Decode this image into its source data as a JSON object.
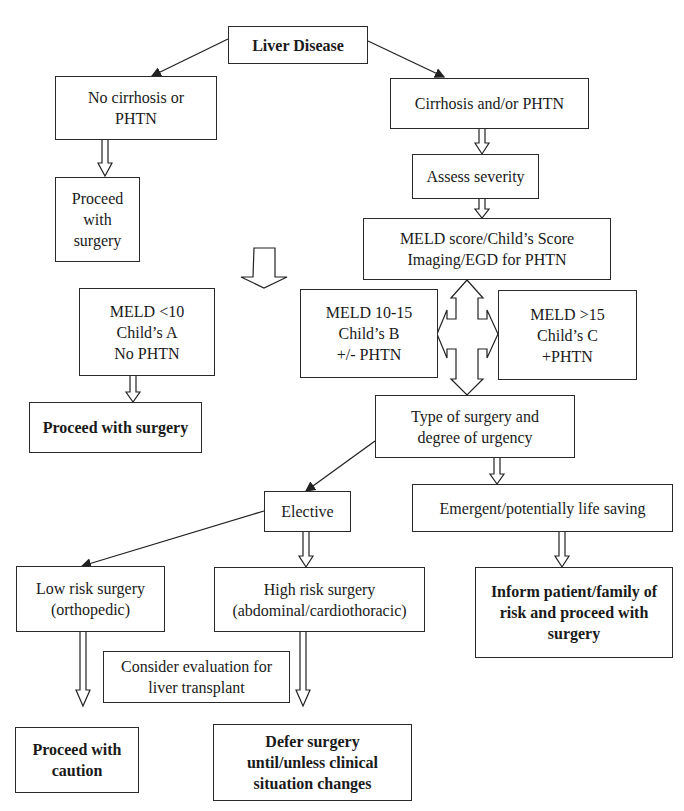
{
  "diagram": {
    "title": "Liver Disease",
    "nodes": {
      "liver_disease": "Liver Disease",
      "no_cirrhosis": "No cirrhosis or\nPHTN",
      "cirrhosis": "Cirrhosis and/or PHTN",
      "proceed_small": "Proceed\nwith\nsurgery",
      "assess_severity": "Assess severity",
      "meld_score": "MELD score/Child’s Score\nImaging/EGD for PHTN",
      "meld_lt10": "MELD <10\nChild’s A\nNo PHTN",
      "meld_10_15": "MELD 10-15\nChild’s B\n+/- PHTN",
      "meld_gt15": "MELD >15\nChild’s C\n+PHTN",
      "proceed_surgery": "Proceed with surgery",
      "type_of_surgery": "Type of surgery and\ndegree of urgency",
      "elective": "Elective",
      "emergent": "Emergent/potentially life saving",
      "low_risk": "Low risk surgery\n(orthopedic)",
      "high_risk": "High risk surgery\n(abdominal/cardiothoracic)",
      "inform_patient": "Inform patient/family of\nrisk and proceed with\nsurgery",
      "consider_transplant": "Consider evaluation for\nliver transplant",
      "proceed_caution": "Proceed with\ncaution",
      "defer_surgery": "Defer surgery\nuntil/unless clinical\nsituation changes"
    },
    "edges": [
      {
        "from": "liver_disease",
        "to": "no_cirrhosis",
        "style": "line-arrow"
      },
      {
        "from": "liver_disease",
        "to": "cirrhosis",
        "style": "line-arrow"
      },
      {
        "from": "no_cirrhosis",
        "to": "proceed_small",
        "style": "hollow-arrow"
      },
      {
        "from": "cirrhosis",
        "to": "assess_severity",
        "style": "hollow-arrow"
      },
      {
        "from": "assess_severity",
        "to": "meld_score",
        "style": "hollow-arrow"
      },
      {
        "from": "meld_score",
        "to": "meld_lt10",
        "style": "big-hollow-arrow"
      },
      {
        "from": "meld_score",
        "to": "meld_10_15",
        "style": "four-way-arrow"
      },
      {
        "from": "meld_score",
        "to": "meld_gt15",
        "style": "four-way-arrow"
      },
      {
        "from": "meld_score",
        "to": "type_of_surgery",
        "style": "four-way-arrow"
      },
      {
        "from": "meld_lt10",
        "to": "proceed_surgery",
        "style": "hollow-arrow"
      },
      {
        "from": "type_of_surgery",
        "to": "elective",
        "style": "line-arrow"
      },
      {
        "from": "type_of_surgery",
        "to": "emergent",
        "style": "hollow-arrow"
      },
      {
        "from": "elective",
        "to": "low_risk",
        "style": "line-arrow"
      },
      {
        "from": "elective",
        "to": "high_risk",
        "style": "hollow-arrow"
      },
      {
        "from": "emergent",
        "to": "inform_patient",
        "style": "hollow-arrow"
      },
      {
        "from": "low_risk",
        "to": "proceed_caution",
        "style": "hollow-arrow"
      },
      {
        "from": "high_risk",
        "to": "defer_surgery",
        "style": "hollow-arrow"
      }
    ]
  }
}
